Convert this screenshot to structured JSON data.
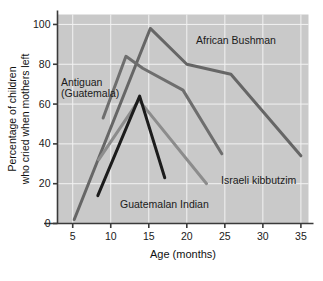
{
  "chart_data": {
    "type": "line",
    "title": "",
    "xlabel": "Age (months)",
    "ylabel": "Percentage of children\nwho cried when mothers left",
    "ylabel_line1": "Percentage of children",
    "ylabel_line2": "who cried when mothers left",
    "xlim": [
      3,
      36
    ],
    "ylim": [
      0,
      105
    ],
    "xticks": [
      5,
      10,
      15,
      20,
      25,
      30,
      35
    ],
    "yticks": [
      0,
      20,
      40,
      60,
      80,
      100
    ],
    "grid": true,
    "grid_color": "#f2f2f2",
    "plot_background": "#c9c9c9",
    "legend": "inline-annotations",
    "series": [
      {
        "name": "African Bushman",
        "color": "#666666",
        "points": [
          [
            5.2,
            2
          ],
          [
            15.2,
            98
          ],
          [
            20.0,
            80
          ],
          [
            25.8,
            75
          ],
          [
            35.0,
            34
          ]
        ]
      },
      {
        "name": "Antiguan (Guatemala)",
        "color": "#6e6e6e",
        "points": [
          [
            9.0,
            53
          ],
          [
            12.0,
            84
          ],
          [
            14.2,
            78
          ],
          [
            19.5,
            67
          ],
          [
            24.6,
            35
          ]
        ]
      },
      {
        "name": "Israeli kibbutzim",
        "color": "#8c8c8c",
        "points": [
          [
            8.4,
            32
          ],
          [
            13.7,
            62
          ],
          [
            22.6,
            20
          ]
        ]
      },
      {
        "name": "Guatemalan Indian",
        "color": "#1c1c1c",
        "points": [
          [
            8.3,
            14
          ],
          [
            13.8,
            64
          ],
          [
            17.1,
            23
          ]
        ]
      }
    ],
    "annotations": [
      {
        "label": "African Bushman",
        "x_px": 196,
        "y_px": 44,
        "color": "#1a1a1a"
      },
      {
        "label": "Antiguan",
        "x_px": 61,
        "y_px": 86,
        "color": "#1a1a1a"
      },
      {
        "label": "(Guatemala)",
        "x_px": 61,
        "y_px": 97,
        "color": "#1a1a1a"
      },
      {
        "label": "Israeli kibbutzim",
        "x_px": 221,
        "y_px": 184,
        "color": "#1a1a1a"
      },
      {
        "label": "Guatemalan Indian",
        "x_px": 120,
        "y_px": 208,
        "color": "#1a1a1a"
      }
    ]
  },
  "figure": {
    "caption": ""
  },
  "axis_tick_labels": {
    "x": [
      "5",
      "10",
      "15",
      "20",
      "25",
      "30",
      "35"
    ],
    "y": [
      "0",
      "20",
      "40",
      "60",
      "80",
      "100"
    ]
  }
}
